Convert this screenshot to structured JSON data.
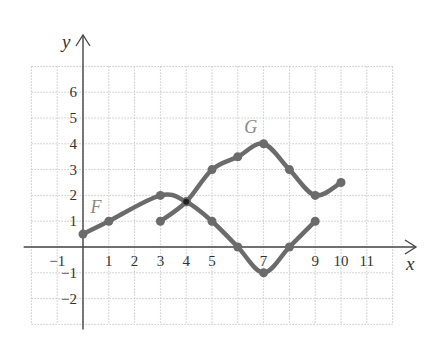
{
  "chart_data": {
    "type": "line",
    "title": "",
    "xlabel": "x",
    "ylabel": "y",
    "xlim": [
      -2,
      12
    ],
    "ylim": [
      -3,
      7
    ],
    "grid": true,
    "x_ticks": [
      "−1",
      "1",
      "2",
      "3",
      "4",
      "5",
      "7",
      "9",
      "10",
      "11"
    ],
    "x_tick_values": [
      -1,
      1,
      2,
      3,
      4,
      5,
      7,
      9,
      10,
      11
    ],
    "y_ticks": [
      "6",
      "5",
      "4",
      "3",
      "2",
      "1",
      "−1",
      "−2"
    ],
    "y_tick_values": [
      6,
      5,
      4,
      3,
      2,
      1,
      -1,
      -2
    ],
    "series": [
      {
        "name": "F",
        "x": [
          0,
          1,
          3,
          4,
          5,
          6,
          7,
          8,
          9
        ],
        "y": [
          0.5,
          1,
          2,
          1.75,
          1,
          0,
          -1,
          0,
          1
        ]
      },
      {
        "name": "G",
        "x": [
          3,
          4,
          5,
          6,
          7,
          8,
          9,
          10
        ],
        "y": [
          1,
          1.75,
          3,
          3.5,
          4,
          3,
          2,
          2.5
        ]
      }
    ],
    "annotations": [
      {
        "text": "F",
        "x": 0.5,
        "y": 1.3
      },
      {
        "text": "G",
        "x": 6.5,
        "y": 4.4
      }
    ],
    "colors": {
      "curve": "#6b6b6b",
      "axis": "#444444",
      "grid": "#c8c8c8"
    }
  }
}
